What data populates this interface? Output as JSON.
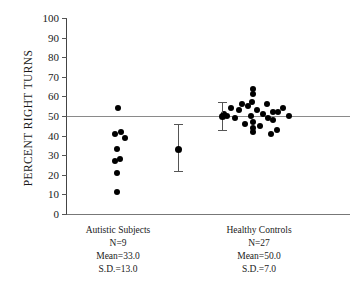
{
  "chart_data": {
    "type": "scatter",
    "title": "",
    "xlabel": "",
    "ylabel": "PERCENT RIGHT TURNS",
    "ylim": [
      0,
      100
    ],
    "ytick_labels": [
      "100",
      "90",
      "80",
      "70",
      "60",
      "50",
      "40",
      "30",
      "20",
      "10",
      "0"
    ],
    "ytick_values": [
      100,
      90,
      80,
      70,
      60,
      50,
      40,
      30,
      20,
      10,
      0
    ],
    "grid": false,
    "legend": "none",
    "reference_line": {
      "value": 50,
      "label": "50% chance level"
    },
    "groups": [
      {
        "name": "Autistic Subjects",
        "n_label": "N=9",
        "mean_label": "Mean=33.0",
        "sd_label": "S.D.=13.0",
        "n": 9,
        "mean": 33.0,
        "sd": 13.0,
        "values": [
          54,
          42,
          41,
          39,
          33,
          28,
          27,
          21,
          11
        ],
        "points": [
          {
            "v": 54,
            "dx": 0
          },
          {
            "v": 42,
            "dx": 3
          },
          {
            "v": 41,
            "dx": -3
          },
          {
            "v": 39,
            "dx": 7
          },
          {
            "v": 33,
            "dx": -1
          },
          {
            "v": 28,
            "dx": 2
          },
          {
            "v": 27,
            "dx": -3
          },
          {
            "v": 21,
            "dx": -1
          },
          {
            "v": 11,
            "dx": -1
          }
        ],
        "errorbar": {
          "center": 33.0,
          "low": 22.0,
          "high": 46.0
        }
      },
      {
        "name": "Healthy Controls",
        "n_label": "N=27",
        "mean_label": "Mean=50.0",
        "sd_label": "S.D.=7.0",
        "n": 27,
        "mean": 50.0,
        "sd": 7.0,
        "values": [
          64,
          61,
          57,
          56,
          56,
          55,
          54,
          54,
          53,
          53,
          52,
          52,
          51,
          51,
          50,
          50,
          50,
          49,
          49,
          48,
          47,
          46,
          45,
          44,
          43,
          42,
          41
        ],
        "points": [
          {
            "v": 64,
            "dx": 2
          },
          {
            "v": 61,
            "dx": 2
          },
          {
            "v": 57,
            "dx": 1
          },
          {
            "v": 56,
            "dx": 16
          },
          {
            "v": 56,
            "dx": -9
          },
          {
            "v": 55,
            "dx": -3
          },
          {
            "v": 54,
            "dx": -20
          },
          {
            "v": 54,
            "dx": 32
          },
          {
            "v": 53,
            "dx": -12
          },
          {
            "v": 53,
            "dx": 6
          },
          {
            "v": 52,
            "dx": 22
          },
          {
            "v": 52,
            "dx": 27
          },
          {
            "v": 51,
            "dx": -27
          },
          {
            "v": 51,
            "dx": 12
          },
          {
            "v": 50,
            "dx": -24
          },
          {
            "v": 50,
            "dx": 0
          },
          {
            "v": 50,
            "dx": 38
          },
          {
            "v": 49,
            "dx": -16
          },
          {
            "v": 49,
            "dx": 17
          },
          {
            "v": 48,
            "dx": 22
          },
          {
            "v": 47,
            "dx": 2
          },
          {
            "v": 46,
            "dx": -6
          },
          {
            "v": 45,
            "dx": 9
          },
          {
            "v": 44,
            "dx": 2
          },
          {
            "v": 43,
            "dx": 26
          },
          {
            "v": 42,
            "dx": 2
          },
          {
            "v": 41,
            "dx": 20
          }
        ],
        "errorbar": {
          "center": 50.0,
          "low": 43.0,
          "high": 57.0
        }
      }
    ]
  },
  "layout": {
    "group_x_positions": [
      52,
      185
    ],
    "errorbar_x_positions": [
      112,
      156
    ]
  }
}
